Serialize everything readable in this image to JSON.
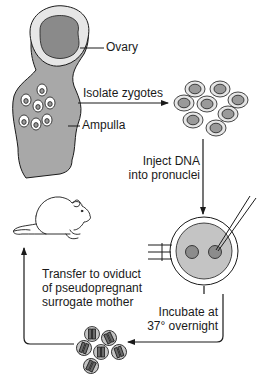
{
  "diagram": {
    "type": "flow-cycle",
    "colors": {
      "line": "#1a1a1a",
      "tissue_fill": "#a8a8a8",
      "ovary_fill": "#8a8a8a",
      "capsule_fill": "#e6e6e6",
      "cell_fill": "#c4c4c4",
      "pronucleus_fill": "#8c8c8c",
      "background": "#ffffff"
    },
    "labels": {
      "ovary": "Ovary",
      "ampulla": "Ampulla",
      "isolate_zygotes": "Isolate zygotes",
      "inject_line1": "Inject DNA",
      "inject_line2": "into pronuclei",
      "incubate_line1": "Incubate at",
      "incubate_line2": "37° overnight",
      "transfer_line1": "Transfer to oviduct",
      "transfer_line2": "of pseudopregnant",
      "transfer_line3": "surrogate mother"
    },
    "nodes": [
      {
        "id": "oviduct",
        "label": "Oviduct with ovary and ampulla"
      },
      {
        "id": "zygotes",
        "label": "Isolated zygotes",
        "count": 8
      },
      {
        "id": "injection",
        "label": "Zygote with two pronuclei, holding pipette and injection needle"
      },
      {
        "id": "two-cell-embryos",
        "label": "Two-cell embryos",
        "count": 6
      },
      {
        "id": "mouse",
        "label": "Surrogate mother mouse"
      }
    ],
    "edges": [
      {
        "from": "oviduct",
        "to": "zygotes",
        "label": "Isolate zygotes"
      },
      {
        "from": "zygotes",
        "to": "injection",
        "label": "Inject DNA into pronuclei"
      },
      {
        "from": "injection",
        "to": "two-cell-embryos",
        "label": "Incubate at 37° overnight"
      },
      {
        "from": "two-cell-embryos",
        "to": "mouse",
        "label": "Transfer to oviduct of pseudopregnant surrogate mother"
      }
    ]
  }
}
